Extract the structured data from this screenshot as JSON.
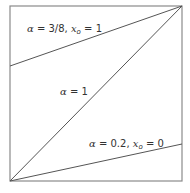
{
  "diagram": {
    "frame": {
      "x0": 10,
      "y0": 6,
      "x1": 182,
      "y1": 181,
      "stroke": "#8a8a8a"
    },
    "line_color": "#555555",
    "curves": [
      {
        "id": "alpha-3-8",
        "alpha_symbol": "α",
        "alpha_eq": " = 3/8, ",
        "x_symbol": "x",
        "x_sub": "o",
        "x_eq": " = 1",
        "from": [
          10,
          66
        ],
        "to": [
          182,
          6
        ]
      },
      {
        "id": "alpha-1",
        "alpha_symbol": "α",
        "alpha_eq": " = 1",
        "from": [
          10,
          181
        ],
        "to": [
          182,
          6
        ]
      },
      {
        "id": "alpha-0-2",
        "alpha_symbol": "α",
        "alpha_eq": " = 0.2, ",
        "x_symbol": "x",
        "x_sub": "o",
        "x_eq": " = 0",
        "from": [
          10,
          181
        ],
        "to": [
          182,
          144
        ]
      }
    ]
  }
}
